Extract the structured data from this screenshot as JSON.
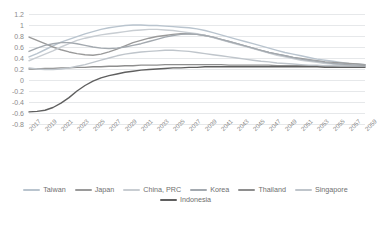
{
  "chart": {
    "title": "",
    "title_note": "title cropped off top edge of screenshot"
  },
  "chart_data": {
    "type": "line",
    "title": "",
    "xlabel": "",
    "ylabel": "",
    "ylim": [
      -0.8,
      1.2
    ],
    "ytick_values": [
      1.2,
      1,
      0.8,
      0.6,
      0.4,
      0.2,
      0,
      -0.2,
      -0.4,
      -0.6,
      -0.8
    ],
    "ytick_labels": [
      "1.2",
      "1",
      "0.8",
      "0.6",
      "0.4",
      "0.2",
      "0",
      "-0.2",
      "-0.4",
      "-0.6",
      "-0.8"
    ],
    "grid": true,
    "grid_axis": "y",
    "legend_position": "bottom",
    "x": [
      2017,
      2018,
      2019,
      2020,
      2021,
      2022,
      2023,
      2024,
      2025,
      2026,
      2027,
      2028,
      2029,
      2030,
      2031,
      2032,
      2033,
      2034,
      2035,
      2036,
      2037,
      2038,
      2039,
      2040,
      2041,
      2042,
      2043,
      2044,
      2045,
      2046,
      2047,
      2048,
      2049,
      2050,
      2051,
      2052,
      2053,
      2054,
      2055,
      2056,
      2057,
      2058,
      2059
    ],
    "xtick_labels": [
      "2017",
      "2019",
      "2021",
      "2023",
      "2025",
      "2027",
      "2029",
      "2031",
      "2033",
      "2035",
      "2037",
      "2039",
      "2041",
      "2043",
      "2045",
      "2047",
      "2049",
      "2051",
      "2053",
      "2055",
      "2057",
      "2059"
    ],
    "series": [
      {
        "name": "Taiwan",
        "color": "#b9c4ce",
        "values": [
          0.42,
          0.48,
          0.55,
          0.62,
          0.69,
          0.74,
          0.79,
          0.84,
          0.88,
          0.92,
          0.95,
          0.97,
          0.99,
          1.0,
          1.0,
          0.99,
          0.99,
          0.98,
          0.97,
          0.96,
          0.95,
          0.93,
          0.9,
          0.86,
          0.82,
          0.78,
          0.74,
          0.7,
          0.66,
          0.62,
          0.58,
          0.54,
          0.5,
          0.47,
          0.44,
          0.41,
          0.38,
          0.36,
          0.34,
          0.32,
          0.3,
          0.29,
          0.28
        ]
      },
      {
        "name": "Japan",
        "color": "#9a9a9a",
        "values": [
          0.78,
          0.72,
          0.66,
          0.6,
          0.55,
          0.51,
          0.48,
          0.46,
          0.45,
          0.47,
          0.51,
          0.56,
          0.62,
          0.68,
          0.72,
          0.76,
          0.79,
          0.81,
          0.83,
          0.84,
          0.84,
          0.83,
          0.81,
          0.78,
          0.74,
          0.7,
          0.66,
          0.62,
          0.58,
          0.54,
          0.5,
          0.47,
          0.44,
          0.41,
          0.39,
          0.37,
          0.35,
          0.33,
          0.32,
          0.31,
          0.3,
          0.29,
          0.28
        ]
      },
      {
        "name": "China, PRC",
        "color": "#c8cdd2",
        "values": [
          0.35,
          0.41,
          0.47,
          0.53,
          0.6,
          0.66,
          0.72,
          0.76,
          0.79,
          0.82,
          0.84,
          0.86,
          0.88,
          0.9,
          0.91,
          0.92,
          0.92,
          0.91,
          0.9,
          0.88,
          0.86,
          0.84,
          0.81,
          0.77,
          0.73,
          0.69,
          0.65,
          0.61,
          0.57,
          0.53,
          0.49,
          0.45,
          0.42,
          0.39,
          0.36,
          0.34,
          0.32,
          0.3,
          0.29,
          0.28,
          0.27,
          0.26,
          0.26
        ]
      },
      {
        "name": "Korea",
        "color": "#a3a9af",
        "values": [
          0.52,
          0.58,
          0.63,
          0.66,
          0.68,
          0.68,
          0.66,
          0.63,
          0.6,
          0.58,
          0.57,
          0.58,
          0.6,
          0.63,
          0.66,
          0.7,
          0.74,
          0.78,
          0.81,
          0.83,
          0.84,
          0.83,
          0.81,
          0.78,
          0.74,
          0.7,
          0.66,
          0.62,
          0.58,
          0.54,
          0.5,
          0.47,
          0.44,
          0.41,
          0.38,
          0.36,
          0.34,
          0.32,
          0.3,
          0.29,
          0.28,
          0.27,
          0.27
        ]
      },
      {
        "name": "Thailand",
        "color": "#8e8e8e",
        "values": [
          0.2,
          0.2,
          0.21,
          0.21,
          0.22,
          0.22,
          0.23,
          0.23,
          0.24,
          0.24,
          0.25,
          0.25,
          0.26,
          0.26,
          0.27,
          0.27,
          0.27,
          0.28,
          0.28,
          0.28,
          0.28,
          0.28,
          0.28,
          0.28,
          0.28,
          0.27,
          0.27,
          0.27,
          0.27,
          0.27,
          0.27,
          0.26,
          0.26,
          0.26,
          0.26,
          0.26,
          0.26,
          0.25,
          0.25,
          0.25,
          0.25,
          0.25,
          0.25
        ]
      },
      {
        "name": "Singapore",
        "color": "#bfc5cb",
        "values": [
          0.22,
          0.2,
          0.19,
          0.19,
          0.2,
          0.22,
          0.25,
          0.28,
          0.32,
          0.36,
          0.4,
          0.44,
          0.47,
          0.49,
          0.51,
          0.52,
          0.53,
          0.54,
          0.54,
          0.53,
          0.52,
          0.5,
          0.48,
          0.46,
          0.44,
          0.42,
          0.4,
          0.38,
          0.36,
          0.34,
          0.33,
          0.31,
          0.3,
          0.29,
          0.28,
          0.27,
          0.27,
          0.26,
          0.26,
          0.25,
          0.25,
          0.25,
          0.24
        ]
      },
      {
        "name": "Indonesia",
        "color": "#5f5f5f",
        "values": [
          -0.58,
          -0.57,
          -0.55,
          -0.5,
          -0.42,
          -0.32,
          -0.2,
          -0.1,
          -0.02,
          0.04,
          0.08,
          0.11,
          0.14,
          0.16,
          0.18,
          0.19,
          0.2,
          0.21,
          0.22,
          0.22,
          0.23,
          0.23,
          0.24,
          0.24,
          0.24,
          0.24,
          0.24,
          0.24,
          0.24,
          0.24,
          0.24,
          0.24,
          0.24,
          0.24,
          0.24,
          0.24,
          0.24,
          0.23,
          0.23,
          0.23,
          0.23,
          0.23,
          0.23
        ]
      }
    ]
  }
}
